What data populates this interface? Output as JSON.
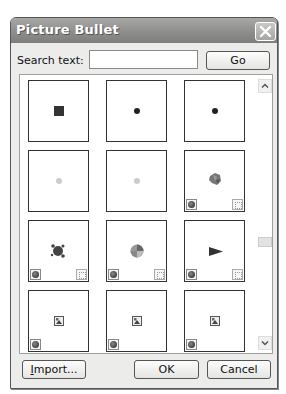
{
  "dialog": {
    "title": "Picture Bullet",
    "close_label": "Close"
  },
  "search": {
    "label": "Search text:",
    "value": "",
    "placeholder": "",
    "go_label": "Go"
  },
  "bullets": [
    {
      "row": 1,
      "col": 1,
      "glyph": "square-bullet",
      "color": "#333333",
      "badges": []
    },
    {
      "row": 1,
      "col": 2,
      "glyph": "dot-bullet",
      "color": "#222222",
      "badges": []
    },
    {
      "row": 1,
      "col": 3,
      "glyph": "dot-bullet",
      "color": "#222222",
      "badges": []
    },
    {
      "row": 2,
      "col": 1,
      "glyph": "light-dot-bullet",
      "color": "#cccccc",
      "badges": []
    },
    {
      "row": 2,
      "col": 2,
      "glyph": "light-dot-bullet",
      "color": "#cccccc",
      "badges": []
    },
    {
      "row": 2,
      "col": 3,
      "glyph": "leaf-cluster-bullet",
      "color": "#777777",
      "badges": [
        "web-icon",
        "animation-icon"
      ]
    },
    {
      "row": 3,
      "col": 1,
      "glyph": "splat-bullet",
      "color": "#444444",
      "badges": [
        "web-icon",
        "animation-icon"
      ]
    },
    {
      "row": 3,
      "col": 2,
      "glyph": "pie-ball-bullet",
      "color": "#777777",
      "badges": [
        "web-icon",
        "animation-icon"
      ]
    },
    {
      "row": 3,
      "col": 3,
      "glyph": "arrow-flag-bullet",
      "color": "#333333",
      "badges": [
        "web-icon",
        "animation-icon"
      ]
    },
    {
      "row": 4,
      "col": 1,
      "glyph": "picture-placeholder-bullet",
      "color": "#555555",
      "badges": [
        "web-icon"
      ]
    },
    {
      "row": 4,
      "col": 2,
      "glyph": "picture-placeholder-bullet",
      "color": "#555555",
      "badges": [
        "web-icon"
      ]
    },
    {
      "row": 4,
      "col": 3,
      "glyph": "picture-placeholder-bullet",
      "color": "#555555",
      "badges": [
        "web-icon"
      ]
    }
  ],
  "buttons": {
    "import_prefix": "",
    "import_accel": "I",
    "import_rest": "mport...",
    "ok": "OK",
    "cancel": "Cancel"
  }
}
